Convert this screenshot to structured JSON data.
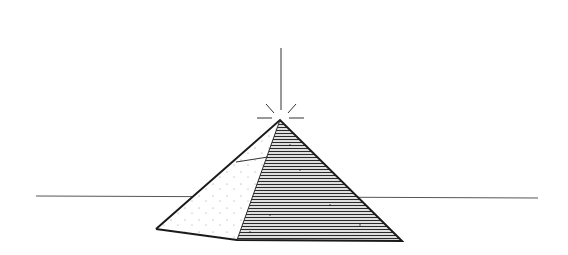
{
  "illustration": {
    "subject": "pyramid with radiant apex on horizon",
    "colors": {
      "background": "#ffffff",
      "ink": "#1a1a1a",
      "horizon": "#555555",
      "lit_face": "#ffffff",
      "hatch": "#2a2a2a"
    },
    "horizon": {
      "x1": 36,
      "y1": 196,
      "x2": 538,
      "y2": 198
    },
    "beam": {
      "x": 281,
      "y_top": 48,
      "y_bottom": 110
    },
    "apex": {
      "x": 280,
      "y": 120
    },
    "base": {
      "left": {
        "x": 156,
        "y": 229
      },
      "front": {
        "x": 237,
        "y": 240
      },
      "right": {
        "x": 402,
        "y": 241
      }
    },
    "inner_line": {
      "x1": 236,
      "y1": 162,
      "x2": 268,
      "y2": 157
    }
  }
}
